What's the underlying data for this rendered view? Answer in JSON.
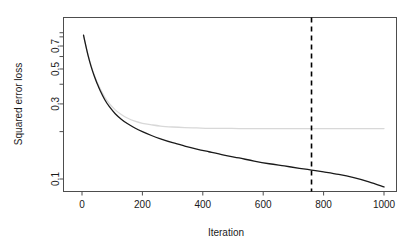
{
  "chart_data": {
    "type": "line",
    "title": "",
    "xlabel": "Iteration",
    "ylabel": "Squared error loss",
    "xlim": [
      0,
      1000
    ],
    "ylim": [
      0.075,
      0.86
    ],
    "yscale": "log",
    "grid": false,
    "legend": "none",
    "xticks": [
      0,
      200,
      400,
      600,
      800,
      1000
    ],
    "xtick_labels": [
      "0",
      "200",
      "400",
      "600",
      "800",
      "1000"
    ],
    "yticks": [
      0.1,
      0.3,
      0.5,
      0.7
    ],
    "ytick_labels": [
      "0.1",
      "0.3",
      "0.5",
      "0.7"
    ],
    "yticks_minor": [
      0.2,
      0.4,
      0.6,
      0.8
    ],
    "series": [
      {
        "name": "training-loss",
        "color": "#1a1a1a",
        "width": 1.3,
        "x": [
          5,
          10,
          20,
          30,
          40,
          50,
          60,
          75,
          90,
          110,
          130,
          150,
          175,
          200,
          230,
          260,
          300,
          340,
          380,
          420,
          470,
          520,
          570,
          620,
          670,
          720,
          760,
          800,
          850,
          900,
          950,
          1000
        ],
        "y": [
          0.82,
          0.74,
          0.61,
          0.52,
          0.455,
          0.405,
          0.365,
          0.32,
          0.289,
          0.26,
          0.24,
          0.225,
          0.211,
          0.2,
          0.189,
          0.18,
          0.17,
          0.162,
          0.155,
          0.149,
          0.142,
          0.136,
          0.13,
          0.125,
          0.121,
          0.117,
          0.114,
          0.111,
          0.107,
          0.102,
          0.096,
          0.089
        ]
      },
      {
        "name": "test-loss",
        "color": "#d8d8d8",
        "width": 1.3,
        "x": [
          5,
          10,
          20,
          30,
          40,
          50,
          60,
          75,
          90,
          110,
          130,
          150,
          175,
          200,
          230,
          260,
          300,
          340,
          380,
          420,
          470,
          520,
          570,
          620,
          670,
          720,
          760,
          800,
          850,
          900,
          950,
          1000
        ],
        "y": [
          0.82,
          0.742,
          0.614,
          0.526,
          0.462,
          0.413,
          0.375,
          0.332,
          0.302,
          0.275,
          0.257,
          0.244,
          0.233,
          0.226,
          0.221,
          0.217,
          0.214,
          0.212,
          0.211,
          0.21,
          0.21,
          0.209,
          0.209,
          0.209,
          0.209,
          0.209,
          0.209,
          0.209,
          0.209,
          0.209,
          0.209,
          0.209
        ]
      }
    ],
    "annotations": [
      {
        "name": "selected-iteration-line",
        "type": "vline",
        "x": 760,
        "style": "dashed",
        "color": "#000000",
        "width": 1.6
      }
    ]
  },
  "colors": {
    "background": "#ffffff",
    "frame": "#4d4d4d",
    "text": "#1a1a1a",
    "main_curve": "#1a1a1a",
    "secondary_curve": "#d8d8d8",
    "vline": "#000000"
  }
}
